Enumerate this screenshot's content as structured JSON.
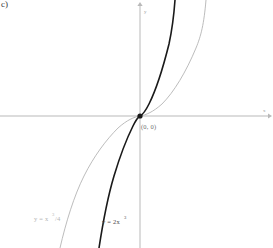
{
  "figure": {
    "part_label": "c)",
    "background_color": "#ffffff",
    "width": 273,
    "height": 248
  },
  "axes": {
    "x_axis_name": "x",
    "y_axis_name": "y",
    "axis_color": "#b9b9b9",
    "origin_x_px": 140,
    "origin_y_px": 116
  },
  "origin_point": {
    "label": "(0, 0)",
    "marker_color": "#1a1a1a",
    "x": 0,
    "y": 0
  },
  "curves": {
    "dark": {
      "label": "y = 2x",
      "exponent": "3",
      "color": "#1a1a1a",
      "stroke_width": 1.6,
      "coefficient": 2
    },
    "light": {
      "label": "y = x",
      "exponent": "3",
      "label_tail": "/4",
      "color": "#b4b4b4",
      "stroke_width": 0.9,
      "coefficient": 0.25
    }
  },
  "chart_data": {
    "type": "line",
    "title": "",
    "xlabel": "x",
    "ylabel": "y",
    "xlim": [
      -4.2,
      4.2
    ],
    "ylim": [
      -4.2,
      4.2
    ],
    "grid": false,
    "legend_position": "inline-bottom",
    "annotations": [
      {
        "text": "(0, 0)",
        "x": 0,
        "y": 0
      },
      {
        "text": "c)",
        "x": null,
        "y": null
      }
    ],
    "series": [
      {
        "name": "y = 2x^3",
        "color": "#1a1a1a",
        "expression": "2*x^3",
        "x": [
          -1.6,
          -1.4,
          -1.2,
          -1.0,
          -0.8,
          -0.6,
          -0.4,
          -0.2,
          0.0,
          0.2,
          0.4,
          0.6,
          0.8,
          1.0,
          1.2,
          1.4
        ],
        "values": [
          -8.19,
          -5.49,
          -3.46,
          -2.0,
          -1.02,
          -0.43,
          -0.13,
          -0.02,
          0.0,
          0.02,
          0.13,
          0.43,
          1.02,
          2.0,
          3.46,
          5.49
        ]
      },
      {
        "name": "y = x^3/4",
        "color": "#b4b4b4",
        "expression": "x^3/4",
        "x": [
          -3.2,
          -2.8,
          -2.4,
          -2.0,
          -1.6,
          -1.2,
          -0.8,
          -0.4,
          0.0,
          0.4,
          0.8,
          1.2,
          1.6,
          2.0,
          2.4,
          2.8,
          3.2
        ],
        "values": [
          -8.19,
          -5.49,
          -3.46,
          -2.0,
          -1.02,
          -0.43,
          -0.13,
          -0.02,
          0.0,
          0.02,
          0.13,
          0.43,
          1.02,
          2.0,
          3.46,
          5.49,
          8.19
        ]
      }
    ]
  }
}
